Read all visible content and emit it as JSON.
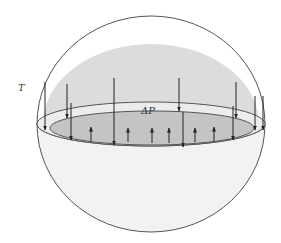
{
  "diagram": {
    "type": "hemisphere-pressure-diagram",
    "labels": {
      "tension": "T",
      "pressure_difference": "ΔP"
    },
    "colors": {
      "outline": "#555555",
      "upper_dome_fill": "#dcdcdc",
      "rim_fill": "#ececec",
      "inner_disk_fill": "#c4c4c4",
      "bowl_fill": "#f2f2f2",
      "arrow": "#222222"
    },
    "down_arrows": [
      {
        "x": 45,
        "y1": 82,
        "y2": 130
      },
      {
        "x": 67,
        "y1": 84,
        "y2": 118
      },
      {
        "x": 71,
        "y1": 103,
        "y2": 140
      },
      {
        "x": 114,
        "y1": 78,
        "y2": 145
      },
      {
        "x": 179,
        "y1": 78,
        "y2": 111
      },
      {
        "x": 183,
        "y1": 112,
        "y2": 147
      },
      {
        "x": 236,
        "y1": 82,
        "y2": 118
      },
      {
        "x": 233,
        "y1": 106,
        "y2": 140
      },
      {
        "x": 255,
        "y1": 96,
        "y2": 130
      },
      {
        "x": 263,
        "y1": 96,
        "y2": 130
      }
    ],
    "up_arrows": [
      {
        "x": 91,
        "y1": 141,
        "y2": 127
      },
      {
        "x": 128,
        "y1": 142,
        "y2": 128
      },
      {
        "x": 152,
        "y1": 143,
        "y2": 128
      },
      {
        "x": 169,
        "y1": 143,
        "y2": 128
      },
      {
        "x": 195,
        "y1": 142,
        "y2": 128
      },
      {
        "x": 214,
        "y1": 141,
        "y2": 127
      }
    ]
  }
}
